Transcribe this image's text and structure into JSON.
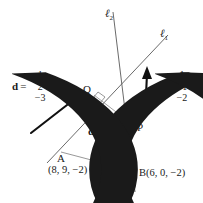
{
  "figure": {
    "type": "geometry-diagram",
    "background_color": "#ffffff",
    "stroke_color": "#4d4d4d",
    "bold_stroke_color": "#111111",
    "text_color": "#1a1a1a"
  },
  "lines": [
    {
      "id": "l1",
      "name": "ℓ",
      "subscript": "1"
    },
    {
      "id": "l2",
      "name": "ℓ",
      "subscript": "2"
    }
  ],
  "points": {
    "A": {
      "letter": "A",
      "coords": "(8, 9, −2)"
    },
    "B": {
      "label": "B(6, 0, −2)"
    },
    "P": {
      "letter": "P"
    },
    "Q": {
      "letter": "Q"
    }
  },
  "vectors": {
    "d": {
      "name": "d",
      "equals": "=",
      "components": [
        "1",
        "2",
        "−3"
      ]
    },
    "e": {
      "name": "e",
      "equals": "=",
      "components": [
        "1",
        "−1",
        "−2"
      ]
    },
    "cross": {
      "left": "d",
      "symbol": "×",
      "right": "e"
    }
  }
}
